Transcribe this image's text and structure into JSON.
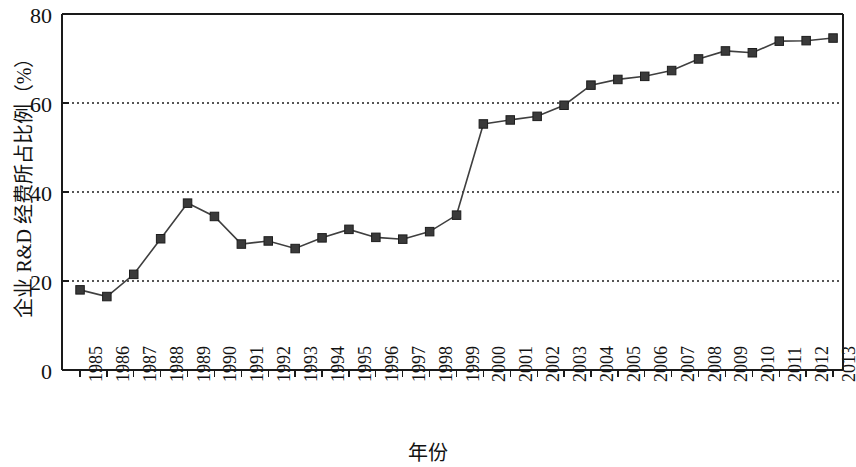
{
  "chart_data": {
    "type": "line",
    "title": "",
    "xlabel": "年份",
    "ylabel": "企业 R&D 经费所占比例（%）",
    "categories": [
      "1985",
      "1986",
      "1987",
      "1988",
      "1989",
      "1990",
      "1991",
      "1992",
      "1993",
      "1994",
      "1995",
      "1996",
      "1997",
      "1998",
      "1999",
      "2000",
      "2001",
      "2002",
      "2003",
      "2004",
      "2005",
      "2006",
      "2007",
      "2008",
      "2009",
      "2010",
      "2011",
      "2012",
      "2013"
    ],
    "values": [
      18.0,
      16.5,
      21.5,
      29.5,
      37.5,
      34.5,
      28.3,
      29.0,
      27.3,
      29.7,
      31.6,
      29.8,
      29.4,
      31.1,
      34.8,
      55.3,
      56.2,
      57.0,
      59.5,
      64.0,
      65.3,
      66.0,
      67.3,
      69.9,
      71.7,
      71.3,
      73.9,
      74.0,
      74.6
    ],
    "ylim": [
      0,
      80
    ],
    "yticks": [
      0,
      20,
      40,
      60,
      80
    ],
    "grid": "horizontal-dotted",
    "legend": "none",
    "series_name": "企业 R&D 经费所占比例",
    "marker": "square",
    "marker_color": "#3a3a3a",
    "line_color": "#3f3f3f",
    "axis_color": "#1a1a1a",
    "grid_color": "#555555",
    "background": "#ffffff"
  },
  "axes": {
    "y_title": "企业 R&D 经费所占比例（%）",
    "x_title": "年份",
    "y_tick_labels": [
      "80",
      "60",
      "40",
      "20",
      "0"
    ],
    "x_tick_labels": [
      "1985",
      "1986",
      "1987",
      "1988",
      "1989",
      "1990",
      "1991",
      "1992",
      "1993",
      "1994",
      "1995",
      "1996",
      "1997",
      "1998",
      "1999",
      "2000",
      "2001",
      "2002",
      "2003",
      "2004",
      "2005",
      "2006",
      "2007",
      "2008",
      "2009",
      "2010",
      "2011",
      "2012",
      "2013"
    ]
  }
}
